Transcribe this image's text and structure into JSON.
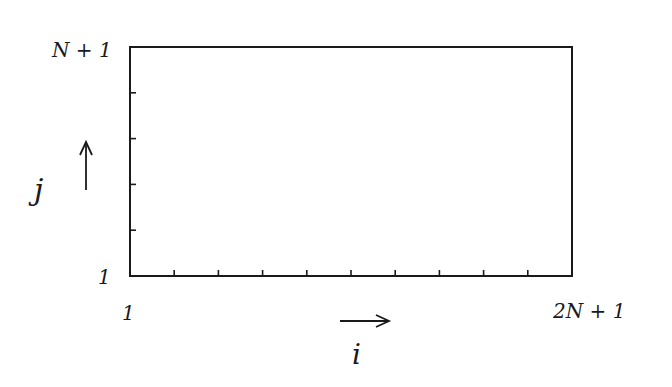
{
  "diagram": {
    "type": "index-grid-domain",
    "box": {
      "x": 130,
      "y": 47,
      "width": 442,
      "height": 229
    },
    "stroke_color": "#1a1a1a",
    "x_axis": {
      "start_label": "1",
      "end_label": "2N + 1",
      "variable": "i",
      "direction": "right",
      "interior_ticks": 9
    },
    "y_axis": {
      "start_label": "1",
      "end_label": "N + 1",
      "variable": "j",
      "direction": "up",
      "interior_ticks": 4
    }
  }
}
